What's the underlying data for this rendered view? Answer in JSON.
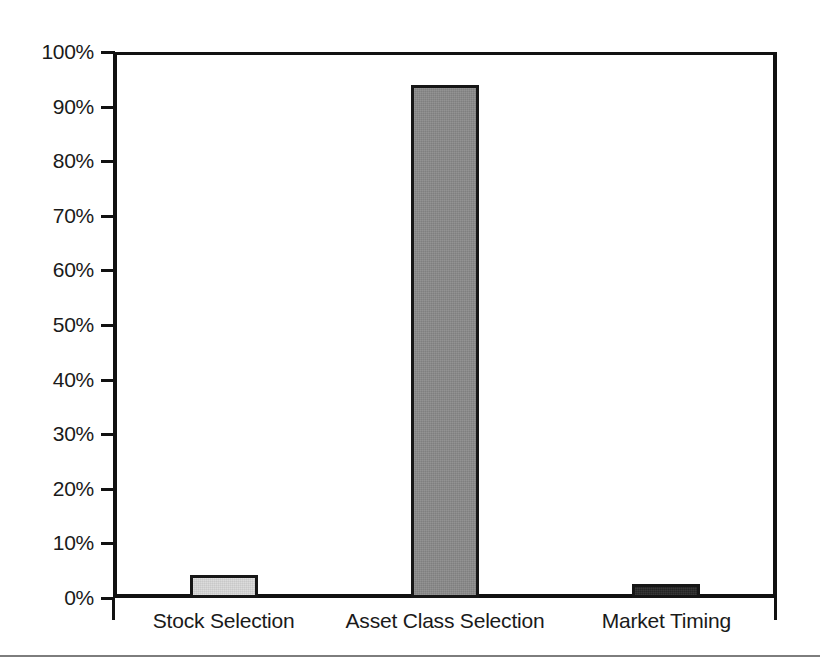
{
  "chart_data": {
    "type": "bar",
    "title": "",
    "subtitle": "",
    "xlabel": "",
    "ylabel": "",
    "categories": [
      "Stock Selection",
      "Asset Class Selection",
      "Market Timing"
    ],
    "values": [
      4.2,
      94.0,
      2.5
    ],
    "value_labels": [
      "4.2%",
      "94.0%",
      "2.5%"
    ],
    "series": [
      {
        "name": "Contribution to Return Variability",
        "values": [
          4.2,
          94.0,
          2.5
        ]
      }
    ],
    "ylim": [
      0,
      100
    ],
    "ytick_values": [
      0,
      10,
      20,
      30,
      40,
      50,
      60,
      70,
      80,
      90,
      100
    ],
    "ytick_labels": [
      "0%",
      "10%",
      "20%",
      "30%",
      "40%",
      "50%",
      "60%",
      "70%",
      "80%",
      "90%",
      "100%"
    ],
    "grid": true,
    "grid_axis": "y",
    "legend": false,
    "legend_position": "none",
    "annotations": [],
    "bar_colors": [
      "#d9d9d9",
      "#8a8a8a",
      "#262626"
    ],
    "bar_edge_color": "#161616",
    "gridline_color": "#9a9a9a",
    "axis_color": "#111111",
    "background_color": "#ffffff"
  },
  "figure": {
    "bottom_rule_color": "#7d7d7d"
  }
}
